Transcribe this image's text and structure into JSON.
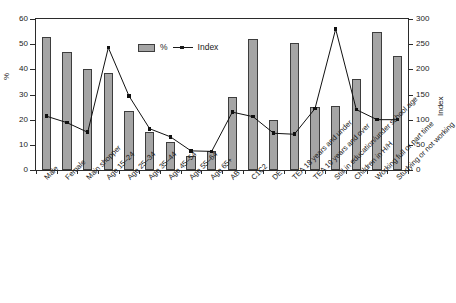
{
  "chart_data": {
    "type": "bar",
    "title": "",
    "xlabel": "",
    "ylabel": "%",
    "y2label": "Index",
    "ylim": [
      0,
      60
    ],
    "y2lim": [
      0,
      300
    ],
    "yticks": [
      0,
      10,
      20,
      30,
      40,
      50,
      60
    ],
    "y2ticks": [
      0,
      50,
      100,
      150,
      200,
      250,
      300
    ],
    "grid": false,
    "legend_position": "upper center",
    "categories": [
      "Male",
      "Female",
      "Main shopper",
      "Age 15–24",
      "Age 25–34",
      "Age 35–44",
      "Age 45–54",
      "Age 55–64",
      "Age 65+",
      "AB",
      "C1C2",
      "DE",
      "TEA 18 years and under",
      "TEA 19 years and over",
      "Still in education/under school age",
      "Children in H/H",
      "Working full or part time",
      "Studying or not working"
    ],
    "series": [
      {
        "name": "%",
        "type": "bar",
        "axis": "left",
        "color": "#a5a5a5",
        "values": [
          53,
          47,
          40,
          38.5,
          23.5,
          15,
          11,
          5.5,
          7.5,
          29,
          52,
          20,
          50.5,
          25,
          25.5,
          36,
          55,
          45.5
        ]
      },
      {
        "name": "Index",
        "type": "line",
        "axis": "right",
        "color": "#111111",
        "values": [
          107,
          94,
          75,
          243,
          147,
          82,
          66,
          38,
          37,
          115,
          106,
          73,
          71,
          122,
          280,
          120,
          100,
          100
        ]
      }
    ]
  },
  "legend": {
    "bar_label": "%",
    "line_label": "Index"
  },
  "axes": {
    "left_title": "%",
    "right_title": "Index",
    "left_ticks": [
      "0",
      "10",
      "20",
      "30",
      "40",
      "50",
      "60"
    ],
    "right_ticks": [
      "0",
      "50",
      "100",
      "150",
      "200",
      "250",
      "300"
    ]
  }
}
